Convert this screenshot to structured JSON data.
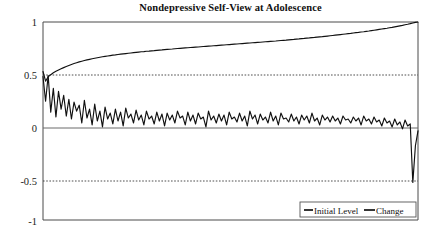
{
  "chart_data": {
    "type": "line",
    "title": "Nondepressive Self-View at Adolescence",
    "xlabel": "",
    "ylabel": "",
    "ylim": [
      -1,
      1
    ],
    "xlim": [
      0,
      1
    ],
    "yticks": [
      1,
      0.5,
      0,
      -0.5,
      -1
    ],
    "ytick_labels": [
      "1",
      "0.5",
      "0",
      "-0.5",
      "-1"
    ],
    "xticks": [],
    "xtick_labels": [],
    "grid": "horizontal dashed at 0.5 and -0.5; solid line at 0",
    "legend_position": "bottom-right",
    "series": [
      {
        "name": "Initial Level",
        "color": "#111111",
        "values": [
          0.5,
          0.402,
          0.447,
          0.468,
          0.487,
          0.502,
          0.515,
          0.527,
          0.539,
          0.55,
          0.561,
          0.571,
          0.58,
          0.589,
          0.597,
          0.604,
          0.611,
          0.617,
          0.623,
          0.629,
          0.634,
          0.639,
          0.644,
          0.649,
          0.653,
          0.657,
          0.661,
          0.665,
          0.668,
          0.672,
          0.675,
          0.678,
          0.681,
          0.684,
          0.687,
          0.69,
          0.693,
          0.696,
          0.699,
          0.701,
          0.704,
          0.706,
          0.709,
          0.711,
          0.714,
          0.716,
          0.718,
          0.721,
          0.723,
          0.725,
          0.727,
          0.73,
          0.732,
          0.734,
          0.736,
          0.738,
          0.74,
          0.742,
          0.744,
          0.746,
          0.748,
          0.75,
          0.752,
          0.754,
          0.756,
          0.758,
          0.76,
          0.762,
          0.764,
          0.766,
          0.768,
          0.77,
          0.772,
          0.774,
          0.776,
          0.778,
          0.78,
          0.782,
          0.784,
          0.786,
          0.788,
          0.79,
          0.792,
          0.794,
          0.796,
          0.798,
          0.8,
          0.802,
          0.804,
          0.806,
          0.808,
          0.811,
          0.813,
          0.815,
          0.817,
          0.82,
          0.822,
          0.824,
          0.827,
          0.829,
          0.832,
          0.834,
          0.837,
          0.839,
          0.842,
          0.844,
          0.847,
          0.85,
          0.852,
          0.855,
          0.858,
          0.861,
          0.864,
          0.867,
          0.87,
          0.873,
          0.876,
          0.879,
          0.882,
          0.885,
          0.889,
          0.892,
          0.895,
          0.899,
          0.902,
          0.906,
          0.909,
          0.913,
          0.917,
          0.921,
          0.925,
          0.929,
          0.933,
          0.937,
          0.942,
          0.946,
          0.951,
          0.956,
          0.961,
          0.966,
          0.972,
          0.977,
          0.983,
          0.99,
          0.996,
          1.0
        ]
      },
      {
        "name": "Change",
        "color": "#111111",
        "values": [
          0.45,
          0.2,
          0.46,
          0.09,
          0.33,
          0.04,
          0.3,
          0.12,
          0.26,
          0.05,
          0.22,
          0.02,
          0.19,
          0.1,
          0.16,
          -0.02,
          0.21,
          0.03,
          0.12,
          -0.04,
          0.17,
          0.0,
          0.1,
          -0.06,
          0.14,
          0.02,
          0.08,
          -0.03,
          0.12,
          0.0,
          0.09,
          -0.05,
          0.13,
          0.03,
          0.07,
          -0.02,
          0.11,
          0.01,
          0.06,
          -0.04,
          0.1,
          0.02,
          0.05,
          -0.03,
          0.09,
          0.0,
          0.07,
          -0.05,
          0.08,
          0.01,
          0.06,
          -0.02,
          0.1,
          0.03,
          0.05,
          -0.04,
          0.09,
          0.0,
          0.06,
          -0.03,
          0.08,
          0.02,
          0.04,
          -0.06,
          0.1,
          0.01,
          0.05,
          -0.02,
          0.07,
          0.0,
          0.06,
          -0.04,
          0.09,
          0.02,
          0.04,
          -0.01,
          0.08,
          0.0,
          0.05,
          -0.05,
          0.1,
          0.02,
          0.06,
          -0.03,
          0.07,
          0.01,
          0.04,
          -0.02,
          0.09,
          0.0,
          0.05,
          -0.04,
          0.08,
          0.02,
          0.03,
          -0.01,
          0.07,
          0.0,
          0.04,
          -0.03,
          0.06,
          0.01,
          0.05,
          -0.02,
          0.08,
          0.0,
          0.03,
          -0.04,
          0.06,
          0.01,
          0.04,
          -0.01,
          0.05,
          0.0,
          0.03,
          -0.03,
          0.05,
          0.01,
          0.02,
          -0.02,
          0.04,
          0.0,
          0.03,
          -0.04,
          0.05,
          0.0,
          0.02,
          -0.03,
          0.04,
          -0.01,
          0.01,
          -0.05,
          0.03,
          -0.02,
          0.0,
          -0.06,
          0.02,
          -0.04,
          -0.01,
          -0.08,
          0.01,
          -0.05,
          -0.03,
          -0.62,
          -0.25,
          -0.1
        ]
      }
    ]
  },
  "legend": {
    "items": [
      {
        "label": "Initial Level"
      },
      {
        "label": "Change"
      }
    ]
  },
  "axes": {
    "y_labels": [
      "1",
      "0.5",
      "0",
      "-0.5",
      "-1"
    ]
  }
}
